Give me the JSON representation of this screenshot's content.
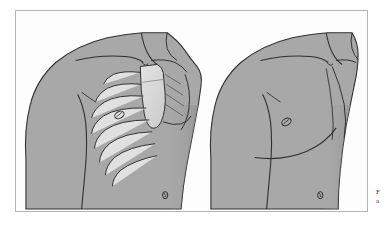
{
  "figure": {
    "frame_border_color": "#b4b4b4",
    "background_color": "#ffffff",
    "plate_background_color": "#fdfdfd",
    "skin_fill_color": "#a8a8a8",
    "bone_fill_color": "#d8d8d8",
    "outline_color": "#303030",
    "shadow_color": "#8e8e8e",
    "panels": [
      {
        "id": "left-panel",
        "label": "Anterior chest with thoracic skeleton overlay",
        "view": "anterior",
        "shows_skeleton": true,
        "structures": [
          "clavicle",
          "sternum",
          "manubrium",
          "costal-cartilage",
          "rib-1",
          "rib-2",
          "rib-3",
          "rib-4",
          "rib-5",
          "rib-6",
          "rib-7",
          "rib-8",
          "nipple",
          "umbilicus",
          "deltoid",
          "pectoralis-major",
          "upper-arm"
        ],
        "rib_pair_count": 8
      },
      {
        "id": "right-panel",
        "label": "Anterior chest surface anatomy",
        "view": "anterior",
        "shows_skeleton": false,
        "structures": [
          "clavicle-contour",
          "suprasternal-notch",
          "nipple",
          "umbilicus",
          "pectoralis-major-border",
          "inframammary-fold",
          "deltoid",
          "upper-arm",
          "axilla"
        ],
        "rib_pair_count": 0
      }
    ]
  },
  "caption": {
    "visible_fragment_line1": "F",
    "visible_fragment_line2": "a",
    "note": "caption text cropped at right image edge"
  }
}
